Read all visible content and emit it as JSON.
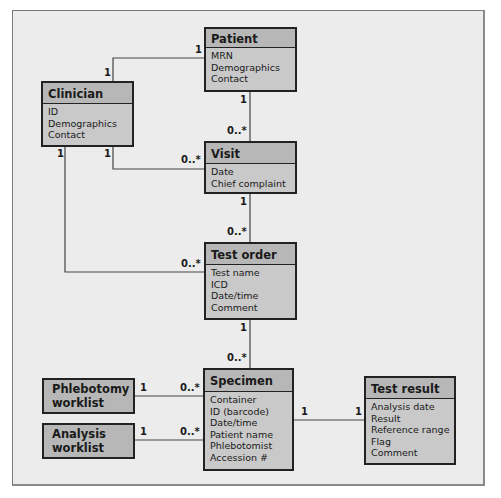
{
  "diagram": {
    "type": "UML class diagram",
    "entities": [
      {
        "id": "patient",
        "name": "Patient",
        "attributes": [
          "MRN",
          "Demographics",
          "Contact"
        ]
      },
      {
        "id": "clinician",
        "name": "Clinician",
        "attributes": [
          "ID",
          "Demographics",
          "Contact"
        ]
      },
      {
        "id": "visit",
        "name": "Visit",
        "attributes": [
          "Date",
          "Chief complaint"
        ]
      },
      {
        "id": "test_order",
        "name": "Test order",
        "attributes": [
          "Test name",
          "ICD",
          "Date/time",
          "Comment"
        ]
      },
      {
        "id": "specimen",
        "name": "Specimen",
        "attributes": [
          "Container",
          "ID (barcode)",
          "Date/time",
          "Patient name",
          "Phlebotomist",
          "Accession #"
        ]
      },
      {
        "id": "test_result",
        "name": "Test result",
        "attributes": [
          "Analysis date",
          "Result",
          "Reference range",
          "Flag",
          "Comment"
        ]
      },
      {
        "id": "phlebotomy_worklist",
        "name_line1": "Phlebotomy",
        "name_line2": "worklist"
      },
      {
        "id": "analysis_worklist",
        "name_line1": "Analysis",
        "name_line2": "worklist"
      }
    ],
    "relationships": [
      {
        "from": "clinician",
        "to": "patient",
        "from_mult": "1",
        "to_mult": "1"
      },
      {
        "from": "patient",
        "to": "visit",
        "from_mult": "1",
        "to_mult": "0..*"
      },
      {
        "from": "clinician",
        "to": "visit",
        "from_mult": "1",
        "to_mult": "0..*"
      },
      {
        "from": "visit",
        "to": "test_order",
        "from_mult": "1",
        "to_mult": "0..*"
      },
      {
        "from": "clinician",
        "to": "test_order",
        "from_mult": "1",
        "to_mult": "0..*"
      },
      {
        "from": "test_order",
        "to": "specimen",
        "from_mult": "1",
        "to_mult": "0..*"
      },
      {
        "from": "phlebotomy_worklist",
        "to": "specimen",
        "from_mult": "1",
        "to_mult": "0..*"
      },
      {
        "from": "analysis_worklist",
        "to": "specimen",
        "from_mult": "1",
        "to_mult": "0..*"
      },
      {
        "from": "specimen",
        "to": "test_result",
        "from_mult": "1",
        "to_mult": "1"
      }
    ]
  },
  "labels": {
    "one": "1",
    "many": "0..*"
  }
}
